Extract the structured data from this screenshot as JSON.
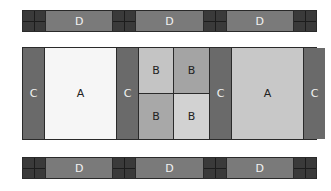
{
  "top_strip": {
    "segments": [
      "D",
      "D",
      "D"
    ]
  },
  "middle": {
    "blocks": [
      {
        "type": "C",
        "label": "C"
      },
      {
        "type": "A",
        "label": "A",
        "color": "#f6f6f6"
      },
      {
        "type": "C",
        "label": "C"
      },
      {
        "type": "B-grid",
        "labels": [
          "B",
          "B",
          "B",
          "B"
        ]
      },
      {
        "type": "C",
        "label": "C"
      },
      {
        "type": "A",
        "label": "A",
        "color": "#c8c8c8"
      },
      {
        "type": "C",
        "label": "C"
      }
    ]
  },
  "bottom_strip": {
    "segments": [
      "D",
      "D",
      "D"
    ]
  },
  "colors": {
    "cross": "#3a3a3a",
    "d": "#7a7a7a",
    "c": "#6a6a6a",
    "a_light": "#f6f6f6",
    "a_gray": "#c8c8c8"
  }
}
